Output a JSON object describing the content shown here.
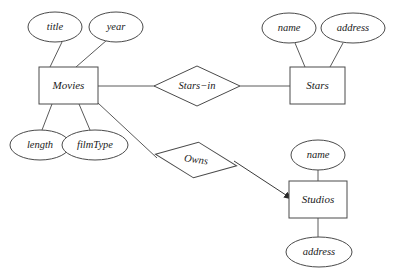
{
  "diagram": {
    "stroke_color": "#4a4a4a",
    "edge_color": "#5a5a5a",
    "text_color": "#1a1a1a",
    "background_color": "#ffffff",
    "entities": [
      {
        "id": "movies",
        "label": "Movies",
        "x": 39,
        "y": 67,
        "w": 59,
        "h": 37
      },
      {
        "id": "stars",
        "label": "Stars",
        "x": 290,
        "y": 67,
        "w": 55,
        "h": 37
      },
      {
        "id": "studios",
        "label": "Studios",
        "x": 289,
        "y": 181,
        "w": 58,
        "h": 37
      }
    ],
    "relationships": [
      {
        "id": "stars-in",
        "label": "Stars−in",
        "cx": 197,
        "cy": 86,
        "rx": 43,
        "ry": 20,
        "rotate": 0
      },
      {
        "id": "owns",
        "label": "Owns",
        "cx": 196,
        "cy": 160,
        "rx": 41,
        "ry": 18,
        "rotate": 8
      }
    ],
    "attributes": [
      {
        "id": "movies-title",
        "label": "title",
        "cx": 55,
        "cy": 27,
        "rx": 27,
        "ry": 15
      },
      {
        "id": "movies-year",
        "label": "year",
        "cx": 116,
        "cy": 27,
        "rx": 27,
        "ry": 15
      },
      {
        "id": "movies-length",
        "label": "length",
        "cx": 40,
        "cy": 145,
        "rx": 30,
        "ry": 15
      },
      {
        "id": "movies-filmtype",
        "label": "filmType",
        "cx": 95,
        "cy": 145,
        "rx": 33,
        "ry": 15
      },
      {
        "id": "stars-name",
        "label": "name",
        "cx": 289,
        "cy": 28,
        "rx": 27,
        "ry": 15
      },
      {
        "id": "stars-address",
        "label": "address",
        "cx": 353,
        "cy": 28,
        "rx": 32,
        "ry": 15
      },
      {
        "id": "studios-name",
        "label": "name",
        "cx": 318,
        "cy": 155,
        "rx": 27,
        "ry": 15
      },
      {
        "id": "studios-address",
        "label": "address",
        "cx": 319,
        "cy": 252,
        "rx": 33,
        "ry": 15
      }
    ],
    "edges": [
      {
        "id": "edge-movies-title",
        "x1": 62,
        "y1": 42,
        "x2": 50,
        "y2": 67,
        "arrow": false
      },
      {
        "id": "edge-movies-year",
        "x1": 107,
        "y1": 40,
        "x2": 76,
        "y2": 67,
        "arrow": false
      },
      {
        "id": "edge-movies-length",
        "x1": 52,
        "y1": 104,
        "x2": 42,
        "y2": 130,
        "arrow": false
      },
      {
        "id": "edge-movies-filmtype",
        "x1": 79,
        "y1": 104,
        "x2": 90,
        "y2": 130,
        "arrow": false
      },
      {
        "id": "edge-movies-starsin",
        "x1": 98,
        "y1": 86,
        "x2": 155,
        "y2": 86,
        "arrow": false
      },
      {
        "id": "edge-starsin-stars",
        "x1": 240,
        "y1": 86,
        "x2": 290,
        "y2": 86,
        "arrow": false
      },
      {
        "id": "edge-stars-name",
        "x1": 295,
        "y1": 43,
        "x2": 305,
        "y2": 67,
        "arrow": false
      },
      {
        "id": "edge-stars-address",
        "x1": 343,
        "y1": 43,
        "x2": 330,
        "y2": 67,
        "arrow": false
      },
      {
        "id": "edge-movies-owns",
        "x1": 98,
        "y1": 103,
        "x2": 157,
        "y2": 158,
        "arrow": false
      },
      {
        "id": "edge-owns-studios",
        "x1": 234,
        "y1": 161,
        "x2": 292,
        "y2": 199,
        "arrow": true
      },
      {
        "id": "edge-studios-name",
        "x1": 318,
        "y1": 170,
        "x2": 318,
        "y2": 181,
        "arrow": false
      },
      {
        "id": "edge-studios-address",
        "x1": 318,
        "y1": 218,
        "x2": 318,
        "y2": 237,
        "arrow": false
      }
    ]
  }
}
